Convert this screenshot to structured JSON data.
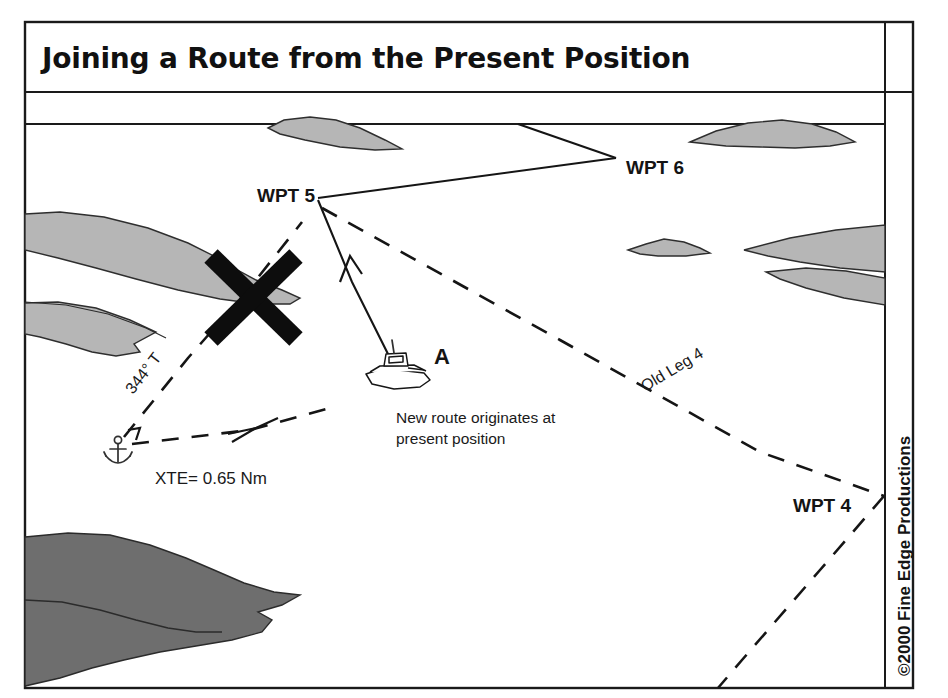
{
  "figure": {
    "title": "Joining a Route from the Present Position",
    "copyright": "©2000 Fine Edge Productions"
  },
  "waypoints": [
    {
      "id": "wpt5",
      "label": "WPT 5"
    },
    {
      "id": "wpt6",
      "label": "WPT 6"
    },
    {
      "id": "wpt4",
      "label": "WPT 4"
    }
  ],
  "annotations": {
    "bearing": "344° T",
    "xte": "XTE= 0.65 Nm",
    "old_leg": "Old Leg 4",
    "present_position_marker": "A",
    "caption_line1": "New route originates at",
    "caption_line2": "present position",
    "cross_out_icon": "x-cross-icon",
    "anchor_icon": "anchor-icon",
    "vessel_icon": "boat-icon"
  },
  "colors": {
    "land_light": "#b6b6b6",
    "land_dark": "#6e6e6e",
    "ink": "#151515",
    "background": "#ffffff"
  }
}
